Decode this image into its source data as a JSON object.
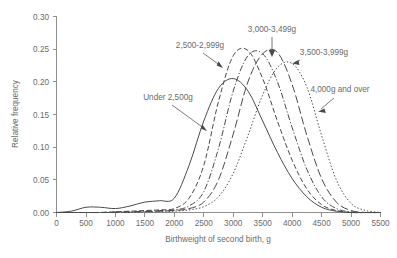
{
  "chart_data": {
    "type": "line",
    "title": "",
    "subtitle": "",
    "xlabel": "Birthweight of second birth, g",
    "ylabel": "Relative frequency",
    "xlim": [
      0,
      5500
    ],
    "ylim": [
      0,
      0.3
    ],
    "grid": false,
    "legend_position": "inline-annotations",
    "xticks": [
      0,
      500,
      1000,
      1500,
      2000,
      2500,
      3000,
      3500,
      4000,
      4500,
      5000,
      5500
    ],
    "xtick_labels": [
      "0",
      "500",
      "1000",
      "1500",
      "2000",
      "2500",
      "3000",
      "3500",
      "4000",
      "4500",
      "5000",
      "5500"
    ],
    "yticks": [
      0.0,
      0.05,
      0.1,
      0.15,
      0.2,
      0.25,
      0.3
    ],
    "ytick_labels": [
      "0.00",
      "0.05",
      "0.10",
      "0.15",
      "0.20",
      "0.25",
      "0.30"
    ],
    "x": [
      0,
      250,
      500,
      750,
      1000,
      1250,
      1500,
      1750,
      2000,
      2250,
      2500,
      2750,
      3000,
      3250,
      3500,
      3750,
      4000,
      4250,
      4500,
      4750,
      5000,
      5250,
      5500
    ],
    "series": [
      {
        "name": "Under 2,500g",
        "line_style": "solid",
        "peak_x": 2850,
        "peak_y": 0.205,
        "values": [
          0.0,
          0.002,
          0.008,
          0.008,
          0.006,
          0.01,
          0.016,
          0.018,
          0.022,
          0.072,
          0.14,
          0.19,
          0.205,
          0.186,
          0.14,
          0.092,
          0.052,
          0.024,
          0.008,
          0.002,
          0.0,
          0.0,
          0.0
        ]
      },
      {
        "name": "2,500-2,999g",
        "line_style": "dashed",
        "peak_x": 3050,
        "peak_y": 0.248,
        "values": [
          0.0,
          0.0,
          0.0,
          0.0,
          0.001,
          0.002,
          0.003,
          0.004,
          0.006,
          0.022,
          0.072,
          0.17,
          0.24,
          0.248,
          0.205,
          0.14,
          0.08,
          0.036,
          0.012,
          0.003,
          0.0,
          0.0,
          0.0
        ]
      },
      {
        "name": "3,000-3,499g",
        "line_style": "dash-dot",
        "peak_x": 3350,
        "peak_y": 0.243,
        "values": [
          0.0,
          0.0,
          0.0,
          0.0,
          0.001,
          0.001,
          0.002,
          0.003,
          0.004,
          0.01,
          0.032,
          0.098,
          0.186,
          0.24,
          0.243,
          0.2,
          0.13,
          0.066,
          0.024,
          0.006,
          0.001,
          0.0,
          0.0
        ]
      },
      {
        "name": "3,500-3,999g",
        "line_style": "long-dash",
        "peak_x": 3700,
        "peak_y": 0.245,
        "values": [
          0.0,
          0.0,
          0.0,
          0.0,
          0.0,
          0.001,
          0.001,
          0.002,
          0.003,
          0.006,
          0.016,
          0.05,
          0.12,
          0.2,
          0.243,
          0.245,
          0.196,
          0.118,
          0.052,
          0.016,
          0.003,
          0.0,
          0.0
        ]
      },
      {
        "name": "4,000g and over",
        "line_style": "dotted",
        "peak_x": 4000,
        "peak_y": 0.228,
        "values": [
          0.0,
          0.0,
          0.0,
          0.0,
          0.0,
          0.0,
          0.001,
          0.001,
          0.002,
          0.004,
          0.009,
          0.024,
          0.06,
          0.118,
          0.18,
          0.222,
          0.228,
          0.192,
          0.118,
          0.05,
          0.014,
          0.003,
          0.0
        ]
      }
    ],
    "annotations": [
      {
        "text": "Under 2,500g",
        "label_x": 168,
        "label_y": 100,
        "arrow_to_x": 207,
        "arrow_to_y": 131
      },
      {
        "text": "2,500-2,999g",
        "label_x": 200,
        "label_y": 48,
        "arrow_to_x": 223,
        "arrow_to_y": 68
      },
      {
        "text": "3,000-3,499g",
        "label_x": 272,
        "label_y": 32,
        "arrow_to_x": 272,
        "arrow_to_y": 56
      },
      {
        "text": "3,500-3,999g",
        "label_x": 320,
        "label_y": 55,
        "arrow_to_x": 293,
        "arrow_to_y": 63
      },
      {
        "text": "4,000g and over",
        "label_x": 338,
        "label_y": 92,
        "arrow_to_x": 318,
        "arrow_to_y": 111
      }
    ]
  }
}
